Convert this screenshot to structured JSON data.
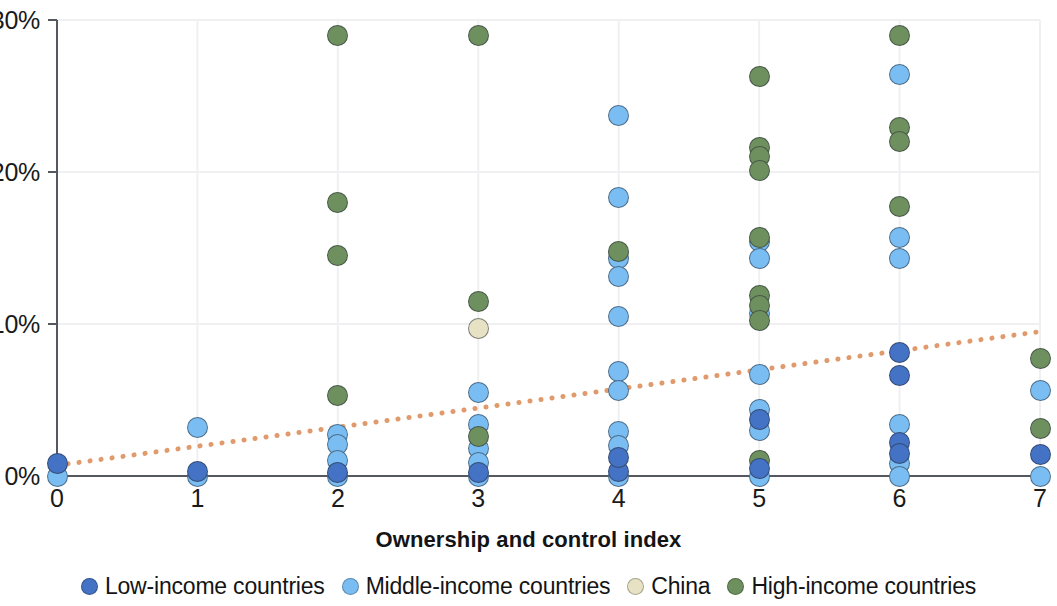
{
  "chart_data": {
    "type": "scatter",
    "title": "",
    "xlabel": "Ownership and control index",
    "ylabel": "",
    "xlim": [
      0,
      7
    ],
    "ylim": [
      0,
      30
    ],
    "grid": true,
    "x_ticks": [
      "0",
      "1",
      "2",
      "3",
      "4",
      "5",
      "6",
      "7"
    ],
    "y_ticks": [
      "0%",
      "10%",
      "20%",
      "30%"
    ],
    "y_tick_values": [
      0,
      10,
      20,
      30
    ],
    "legend_position": "bottom",
    "colors": {
      "low_income": "#4472c4",
      "middle_income": "#79bdf2",
      "china": "#e6e2c3",
      "high_income": "#6e8f5e",
      "trendline": "#e09a6b",
      "axis": "#55585e",
      "grid": "#f0f0f2"
    },
    "trendline": {
      "style": "dotted",
      "color": "#e09a6b",
      "x_start": 0,
      "y_start": 0.7,
      "x_end": 7,
      "y_end": 9.5
    },
    "series": [
      {
        "name": "Low-income countries",
        "color": "#4472c4",
        "points": [
          {
            "x": 0,
            "y": 0.8
          },
          {
            "x": 1,
            "y": 0.3
          },
          {
            "x": 2,
            "y": 0.2
          },
          {
            "x": 3,
            "y": 0.2
          },
          {
            "x": 4,
            "y": 0.3
          },
          {
            "x": 4,
            "y": 1.2
          },
          {
            "x": 5,
            "y": 0.5
          },
          {
            "x": 5,
            "y": 3.7
          },
          {
            "x": 6,
            "y": 8.1
          },
          {
            "x": 6,
            "y": 6.6
          },
          {
            "x": 6,
            "y": 2.2
          },
          {
            "x": 6,
            "y": 1.5
          },
          {
            "x": 7,
            "y": 1.4
          }
        ]
      },
      {
        "name": "Middle-income countries",
        "color": "#79bdf2",
        "points": [
          {
            "x": 0,
            "y": 0.0
          },
          {
            "x": 1,
            "y": 3.2
          },
          {
            "x": 1,
            "y": 0.0
          },
          {
            "x": 2,
            "y": 2.7
          },
          {
            "x": 2,
            "y": 2.1
          },
          {
            "x": 2,
            "y": 1.0
          },
          {
            "x": 2,
            "y": 0.0
          },
          {
            "x": 3,
            "y": 5.5
          },
          {
            "x": 3,
            "y": 3.4
          },
          {
            "x": 3,
            "y": 1.8
          },
          {
            "x": 3,
            "y": 0.9
          },
          {
            "x": 3,
            "y": 0.0
          },
          {
            "x": 4,
            "y": 23.7
          },
          {
            "x": 4,
            "y": 18.3
          },
          {
            "x": 4,
            "y": 14.3
          },
          {
            "x": 4,
            "y": 13.1
          },
          {
            "x": 4,
            "y": 10.5
          },
          {
            "x": 4,
            "y": 6.9
          },
          {
            "x": 4,
            "y": 5.6
          },
          {
            "x": 4,
            "y": 2.9
          },
          {
            "x": 4,
            "y": 2.0
          },
          {
            "x": 4,
            "y": 0.0
          },
          {
            "x": 5,
            "y": 15.4
          },
          {
            "x": 5,
            "y": 14.3
          },
          {
            "x": 5,
            "y": 10.7
          },
          {
            "x": 5,
            "y": 6.7
          },
          {
            "x": 5,
            "y": 4.4
          },
          {
            "x": 5,
            "y": 3.0
          },
          {
            "x": 5,
            "y": 0.0
          },
          {
            "x": 6,
            "y": 26.4
          },
          {
            "x": 6,
            "y": 15.7
          },
          {
            "x": 6,
            "y": 14.3
          },
          {
            "x": 6,
            "y": 3.4
          },
          {
            "x": 6,
            "y": 0.8
          },
          {
            "x": 6,
            "y": 0.0
          },
          {
            "x": 7,
            "y": 5.6
          },
          {
            "x": 7,
            "y": 0.0
          }
        ]
      },
      {
        "name": "China",
        "color": "#e6e2c3",
        "points": [
          {
            "x": 3,
            "y": 9.7
          }
        ]
      },
      {
        "name": "High-income countries",
        "color": "#6e8f5e",
        "points": [
          {
            "x": 2,
            "y": 29.0
          },
          {
            "x": 2,
            "y": 18.0
          },
          {
            "x": 2,
            "y": 14.5
          },
          {
            "x": 2,
            "y": 5.3
          },
          {
            "x": 3,
            "y": 29.0
          },
          {
            "x": 3,
            "y": 11.5
          },
          {
            "x": 3,
            "y": 2.6
          },
          {
            "x": 4,
            "y": 14.8
          },
          {
            "x": 5,
            "y": 26.3
          },
          {
            "x": 5,
            "y": 21.6
          },
          {
            "x": 5,
            "y": 21.0
          },
          {
            "x": 5,
            "y": 20.1
          },
          {
            "x": 5,
            "y": 15.7
          },
          {
            "x": 5,
            "y": 11.9
          },
          {
            "x": 5,
            "y": 11.2
          },
          {
            "x": 5,
            "y": 10.2
          },
          {
            "x": 5,
            "y": 1.0
          },
          {
            "x": 6,
            "y": 29.0
          },
          {
            "x": 6,
            "y": 22.9
          },
          {
            "x": 6,
            "y": 22.0
          },
          {
            "x": 6,
            "y": 17.7
          },
          {
            "x": 7,
            "y": 7.7
          },
          {
            "x": 7,
            "y": 3.1
          }
        ]
      }
    ]
  },
  "axis": {
    "x_title": "Ownership and control index",
    "x_ticks": [
      "0",
      "1",
      "2",
      "3",
      "4",
      "5",
      "6",
      "7"
    ],
    "y_ticks": [
      "0%",
      "10%",
      "20%",
      "30%"
    ]
  },
  "legend": {
    "items": [
      {
        "label": "Low-income countries",
        "color": "#4472c4"
      },
      {
        "label": "Middle-income countries",
        "color": "#79bdf2"
      },
      {
        "label": "China",
        "color": "#e6e2c3"
      },
      {
        "label": "High-income countries",
        "color": "#6e8f5e"
      }
    ]
  }
}
